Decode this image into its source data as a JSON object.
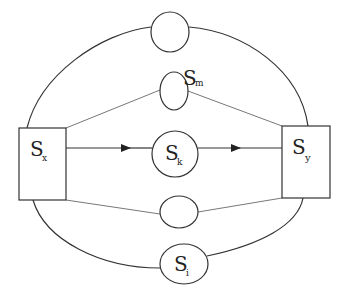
{
  "diagram": {
    "type": "network-graph",
    "colors": {
      "stroke": "#333333",
      "thin_stroke": "#777777",
      "background": "#ffffff",
      "text": "#222222"
    },
    "nodes": {
      "sx": {
        "label": "S",
        "sub": "x",
        "shape": "square"
      },
      "sy": {
        "label": "S",
        "sub": "y",
        "shape": "square"
      },
      "sk": {
        "label": "S",
        "sub": "k",
        "shape": "circle"
      },
      "sm": {
        "label": "S",
        "sub": "m",
        "shape": "ellipse"
      },
      "si": {
        "label": "S",
        "sub": "i",
        "shape": "ellipse"
      },
      "top": {
        "label": "",
        "shape": "circle"
      },
      "lower": {
        "label": "",
        "shape": "ellipse"
      }
    },
    "edges": [
      {
        "from": "sx",
        "to": "sk",
        "style": "arrow"
      },
      {
        "from": "sk",
        "to": "sy",
        "style": "arrow"
      },
      {
        "from": "sx",
        "to": "sm",
        "style": "thin line"
      },
      {
        "from": "sm",
        "to": "sy",
        "style": "thin line"
      },
      {
        "from": "sx",
        "to": "lower",
        "style": "thin line"
      },
      {
        "from": "lower",
        "to": "sy",
        "style": "thin line"
      },
      {
        "from": "sx",
        "to": "top",
        "style": "curved arc"
      },
      {
        "from": "top",
        "to": "sy",
        "style": "curved arc"
      },
      {
        "from": "sx",
        "to": "si",
        "style": "curved arc"
      },
      {
        "from": "si",
        "to": "sy",
        "style": "curved arc"
      }
    ]
  }
}
